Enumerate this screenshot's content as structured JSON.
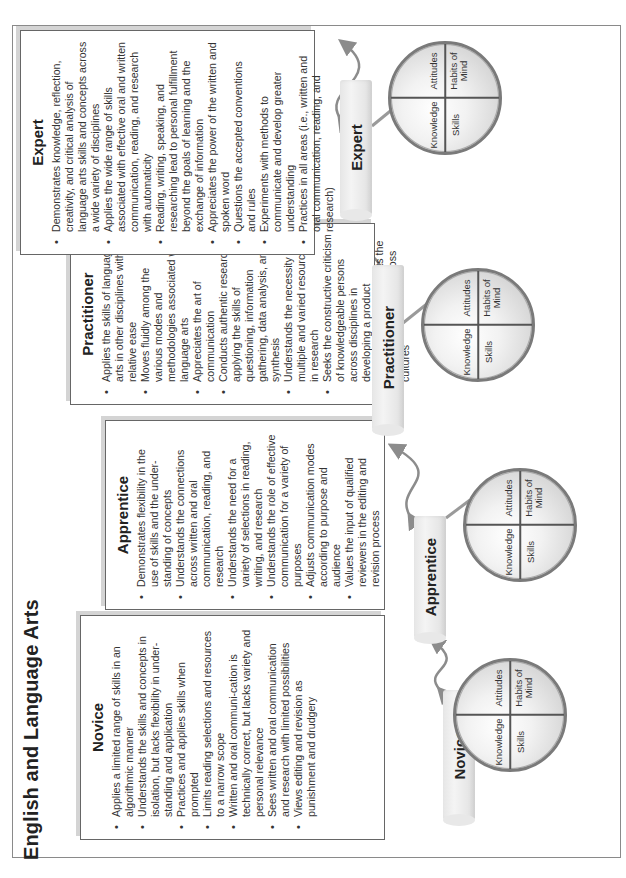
{
  "page": {
    "title": "English and Language Arts",
    "orientation": "rotated-90-ccw"
  },
  "stages": [
    {
      "name": "Novice",
      "heading": "Novice",
      "bullets": [
        "Applies a limited range of skills in an algorithmic manner",
        "Understands the skills and concepts in isolation, but lacks flexibility in under-standing and application",
        "Practices and applies skills when prompted",
        "Limits reading selections and resources to a narrow scope",
        "Written and oral communi-cation is technically correct, but lacks variety and personal relevance",
        "Sees written and oral communication and research with limited possibilities",
        "Views editing and revision as punishment and drudgery"
      ]
    },
    {
      "name": "Apprentice",
      "heading": "Apprentice",
      "bullets": [
        "Demonstrates flexibility in the use of skills and the under-standing of concepts",
        "Understands the connections across written and oral communication, reading, and research",
        "Understands the need for a variety of selections in reading, writing, and research",
        "Understands the role of effective communication for a variety of purposes",
        "Adjusts communication modes according to purpose and audience",
        "Values the input of qualified reviewers in the editing and revision process"
      ]
    },
    {
      "name": "Practitioner",
      "heading": "Practitioner",
      "bullets": [
        "Applies the skills of language arts in other disciplines with relative ease",
        "Moves fluidly among the various modes and methodologies associated with language arts",
        "Appreciates the art of communication",
        "Conducts authentic research applying the skills of questioning, information gathering, data analysis, and synthesis",
        "Understands the necessity for multiple and varied resources in research",
        "Seeks the constructive criticism of knowledgeable persons across disciplines in developing a product",
        "Understands and respects the diversity of language across cultures"
      ]
    },
    {
      "name": "Expert",
      "heading": "Expert",
      "bullets": [
        "Demonstrates knowledge, reflection, creativity, and critical analysis of language arts skills and concepts across a wide variety of disciplines",
        "Applies the wide range of skills associated with effective oral and written communication, reading, and research with automaticity",
        "Reading, writing, speaking, and researching lead to personal fulfillment beyond the goals of learning and the exchange of information",
        "Appreciates the power of the written and spoken word",
        "Questions the accepted conventions and rules",
        "Experiments with methods to communicate and develop greater understanding",
        "Practices in all areas (i.e., written and oral communication, reading, and research)"
      ]
    }
  ],
  "circle_quadrants": {
    "top_left": "Knowledge",
    "top_right": "Skills",
    "bottom_left": "Attitudes",
    "bottom_right": "Habits of Mind"
  },
  "colors": {
    "frame": "#8a8a8a",
    "box_border": "#666666",
    "box_shadow": "#d4d4d4",
    "arrow": "#8c8c8c",
    "pill": "#e6e6e6",
    "circle_ring": "#7a7a7a"
  }
}
